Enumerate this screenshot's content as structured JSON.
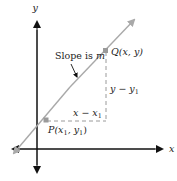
{
  "diagram": {
    "type": "coordinate-plane-line-through-two-points",
    "axes": {
      "x_label": "x",
      "y_label": "y",
      "color": "#111111"
    },
    "line": {
      "color": "#a9a9a9",
      "description": "Line with positive slope, arrows at both ends"
    },
    "points": [
      {
        "id": "P",
        "label_name": "P",
        "label_coords": "(x",
        "sub1": "1",
        "mid": ", y",
        "sub2": "1",
        "close": ")"
      },
      {
        "id": "Q",
        "label_name": "Q",
        "label_coords": "(x, y)"
      }
    ],
    "annotations": {
      "slope_text": "Slope is ",
      "slope_var": "m",
      "run_text": "x − x",
      "run_sub": "1",
      "rise_text": "y − y",
      "rise_sub": "1"
    },
    "colors": {
      "point": "#9a9a9a",
      "dashed": "#9a9a9a",
      "text": "#222222"
    }
  }
}
